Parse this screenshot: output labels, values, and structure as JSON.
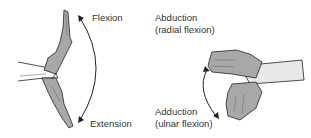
{
  "diagram": {
    "left_panel": {
      "labels": {
        "top": "Flexion",
        "bottom": "Extension"
      }
    },
    "right_panel": {
      "labels": {
        "top_line1": "Abduction",
        "top_line2": "(radial flexion)",
        "bottom_line1": "Adduction",
        "bottom_line2": "(ulnar flexion)"
      }
    },
    "colors": {
      "hand_fill": "#a8a8a8",
      "outline": "#222222",
      "arrow": "#222222",
      "text": "#333333"
    }
  }
}
